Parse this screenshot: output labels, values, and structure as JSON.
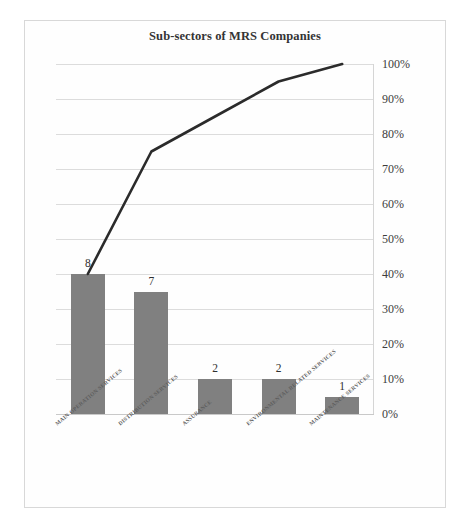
{
  "chart": {
    "title": "Sub-sectors of MRS Companies",
    "bar_color": "#808080",
    "line_color": "#2b2b2b",
    "frame_color": "#d8d8d8",
    "grid_color": "#dcdcdc"
  },
  "chart_data": {
    "type": "bar",
    "title": "Sub-sectors of MRS Companies",
    "xlabel": "",
    "ylabel": "",
    "grid": true,
    "legend": "none",
    "categories": [
      "MAIN OPERATION SERVICES",
      "DISTRIBUTION SERVICES",
      "ASSURANCE",
      "ENVIRONMENTAL RELATED SERVICES",
      "MAINTENANCE SERVICES"
    ],
    "series": [
      {
        "name": "Count",
        "type": "bar",
        "values": [
          8,
          7,
          2,
          2,
          1
        ],
        "data_labels": [
          "8",
          "7",
          "2",
          "2",
          "1"
        ],
        "axis": "left",
        "total": 20
      },
      {
        "name": "Cumulative %",
        "type": "line",
        "values": [
          40,
          75,
          85,
          95,
          100
        ],
        "axis": "right"
      }
    ],
    "y2lim": [
      0,
      100
    ],
    "y2ticks": [
      0,
      10,
      20,
      30,
      40,
      50,
      60,
      70,
      80,
      90,
      100
    ],
    "y2ticklabels": [
      "0%",
      "10%",
      "20%",
      "30%",
      "40%",
      "50%",
      "60%",
      "70%",
      "80%",
      "90%",
      "100%"
    ]
  }
}
